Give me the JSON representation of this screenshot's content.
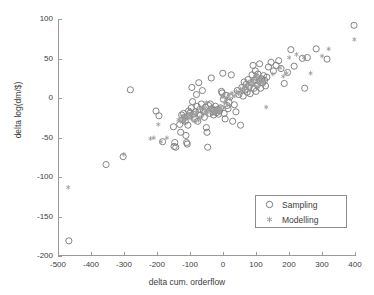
{
  "chart_data": {
    "type": "scatter",
    "title": "",
    "xlabel": "delta cum. orderflow",
    "ylabel": "delta log(dm/$)",
    "xlim": [
      -500,
      400
    ],
    "ylim": [
      -200,
      100
    ],
    "xticks": [
      -500,
      -400,
      -300,
      -200,
      -100,
      0,
      100,
      200,
      300,
      400
    ],
    "yticks": [
      -200,
      -150,
      -100,
      -50,
      0,
      50,
      100
    ],
    "xtick_labels": [
      "-500",
      "-400",
      "-300",
      "-200",
      "-100",
      "0",
      "100",
      "200",
      "300",
      "400"
    ],
    "ytick_labels": [
      "-200",
      "-150",
      "-100",
      "-50",
      "0",
      "50",
      "100"
    ],
    "grid": false,
    "legend_position": "lower right",
    "marker_color": "#808080",
    "axis_color": "#9a9a9a",
    "text_color": "#3d3d3d",
    "series": [
      {
        "name": "Sampling",
        "marker": "circle-open",
        "color": "#7d7d7d",
        "points": [
          [
            -470,
            -182
          ],
          [
            -357,
            -85
          ],
          [
            -305,
            -75
          ],
          [
            -283,
            10
          ],
          [
            -205,
            -17
          ],
          [
            -196,
            -23
          ],
          [
            -185,
            -56
          ],
          [
            -152,
            -37
          ],
          [
            -150,
            -62
          ],
          [
            -148,
            -57
          ],
          [
            -145,
            -63
          ],
          [
            -133,
            -34
          ],
          [
            -130,
            -44
          ],
          [
            -127,
            -22
          ],
          [
            -124,
            -28
          ],
          [
            -121,
            -20
          ],
          [
            -118,
            -25
          ],
          [
            -116,
            -30
          ],
          [
            -114,
            -48
          ],
          [
            -112,
            -57
          ],
          [
            -110,
            -59
          ],
          [
            -108,
            -35
          ],
          [
            -106,
            -17
          ],
          [
            -104,
            -23
          ],
          [
            -101,
            -19
          ],
          [
            -98,
            -13
          ],
          [
            -96,
            13
          ],
          [
            -94,
            -5
          ],
          [
            -91,
            -21
          ],
          [
            -88,
            -27
          ],
          [
            -85,
            -18
          ],
          [
            -82,
            4
          ],
          [
            -80,
            -11
          ],
          [
            -78,
            -30
          ],
          [
            -75,
            19
          ],
          [
            -72,
            -15
          ],
          [
            -70,
            -22
          ],
          [
            -67,
            -8
          ],
          [
            -64,
            9
          ],
          [
            -61,
            -17
          ],
          [
            -58,
            -25
          ],
          [
            -55,
            -12
          ],
          [
            -52,
            -38
          ],
          [
            -50,
            -44
          ],
          [
            -48,
            -63
          ],
          [
            -45,
            -10
          ],
          [
            -42,
            -20
          ],
          [
            -40,
            -8
          ],
          [
            -37,
            25
          ],
          [
            -35,
            -14
          ],
          [
            -32,
            -18
          ],
          [
            -30,
            -22
          ],
          [
            -27,
            -16
          ],
          [
            -24,
            -11
          ],
          [
            -21,
            -19
          ],
          [
            -18,
            -15
          ],
          [
            -15,
            -21
          ],
          [
            -12,
            -17
          ],
          [
            -9,
            -13
          ],
          [
            -6,
            8
          ],
          [
            -4,
            6
          ],
          [
            -2,
            31
          ],
          [
            0,
            -2
          ],
          [
            2,
            -20
          ],
          [
            5,
            -27
          ],
          [
            8,
            3
          ],
          [
            11,
            -10
          ],
          [
            14,
            -14
          ],
          [
            17,
            -6
          ],
          [
            20,
            1
          ],
          [
            24,
            29
          ],
          [
            28,
            -30
          ],
          [
            33,
            -9
          ],
          [
            38,
            -18
          ],
          [
            42,
            9
          ],
          [
            47,
            4
          ],
          [
            52,
            -35
          ],
          [
            56,
            13
          ],
          [
            60,
            2
          ],
          [
            63,
            20
          ],
          [
            66,
            10
          ],
          [
            69,
            17
          ],
          [
            72,
            7
          ],
          [
            75,
            23
          ],
          [
            78,
            14
          ],
          [
            81,
            5
          ],
          [
            84,
            19
          ],
          [
            87,
            29
          ],
          [
            90,
            41
          ],
          [
            93,
            12
          ],
          [
            95,
            22
          ],
          [
            97,
            34
          ],
          [
            99,
            8
          ],
          [
            101,
            26
          ],
          [
            103,
            16
          ],
          [
            105,
            30
          ],
          [
            108,
            21
          ],
          [
            110,
            43
          ],
          [
            113,
            12
          ],
          [
            116,
            24
          ],
          [
            119,
            19
          ],
          [
            122,
            28
          ],
          [
            125,
            22
          ],
          [
            128,
            15
          ],
          [
            132,
            26
          ],
          [
            137,
            39
          ],
          [
            145,
            45
          ],
          [
            152,
            34
          ],
          [
            160,
            41
          ],
          [
            168,
            47
          ],
          [
            175,
            37
          ],
          [
            185,
            18
          ],
          [
            195,
            32
          ],
          [
            205,
            61
          ],
          [
            215,
            40
          ],
          [
            240,
            50
          ],
          [
            247,
            12
          ],
          [
            255,
            51
          ],
          [
            282,
            62
          ],
          [
            315,
            49
          ],
          [
            397,
            92
          ]
        ]
      },
      {
        "name": "Modelling",
        "marker": "star",
        "color": "#9d9d9d",
        "points": [
          [
            -472,
            -114
          ],
          [
            -303,
            -72
          ],
          [
            -222,
            -52
          ],
          [
            -212,
            -51
          ],
          [
            -198,
            -34
          ],
          [
            -190,
            -56
          ],
          [
            -172,
            -51
          ],
          [
            -137,
            -28
          ],
          [
            -130,
            -30
          ],
          [
            -126,
            -24
          ],
          [
            -122,
            -27
          ],
          [
            -119,
            -31
          ],
          [
            -115,
            -23
          ],
          [
            -112,
            -26
          ],
          [
            -108,
            -20
          ],
          [
            -104,
            -25
          ],
          [
            -100,
            -22
          ],
          [
            -96,
            -27
          ],
          [
            -92,
            -19
          ],
          [
            -88,
            -30
          ],
          [
            -84,
            -22
          ],
          [
            -80,
            -18
          ],
          [
            -76,
            -29
          ],
          [
            -72,
            -25
          ],
          [
            -68,
            -14
          ],
          [
            -64,
            -21
          ],
          [
            -60,
            -12
          ],
          [
            -56,
            -18
          ],
          [
            -52,
            -6
          ],
          [
            -48,
            -19
          ],
          [
            -44,
            -16
          ],
          [
            -40,
            -13
          ],
          [
            -36,
            -17
          ],
          [
            -32,
            -20
          ],
          [
            -28,
            -15
          ],
          [
            -24,
            -18
          ],
          [
            -20,
            -16
          ],
          [
            -16,
            -14
          ],
          [
            -12,
            -17
          ],
          [
            -8,
            -12
          ],
          [
            -4,
            1
          ],
          [
            0,
            2
          ],
          [
            4,
            -6
          ],
          [
            8,
            -3
          ],
          [
            12,
            -9
          ],
          [
            16,
            4
          ],
          [
            20,
            -1
          ],
          [
            26,
            6
          ],
          [
            33,
            2
          ],
          [
            40,
            8
          ],
          [
            46,
            5
          ],
          [
            52,
            11
          ],
          [
            57,
            7
          ],
          [
            61,
            14
          ],
          [
            65,
            9
          ],
          [
            69,
            16
          ],
          [
            73,
            12
          ],
          [
            77,
            18
          ],
          [
            81,
            10
          ],
          [
            85,
            20
          ],
          [
            88,
            15
          ],
          [
            91,
            23
          ],
          [
            94,
            17
          ],
          [
            97,
            27
          ],
          [
            100,
            29
          ],
          [
            103,
            13
          ],
          [
            106,
            24
          ],
          [
            109,
            18
          ],
          [
            112,
            22
          ],
          [
            115,
            26
          ],
          [
            118,
            20
          ],
          [
            122,
            16
          ],
          [
            126,
            21
          ],
          [
            130,
            -12
          ],
          [
            150,
            30
          ],
          [
            172,
            38
          ],
          [
            182,
            27
          ],
          [
            192,
            31
          ],
          [
            200,
            51
          ],
          [
            222,
            55
          ],
          [
            245,
            51
          ],
          [
            265,
            31
          ],
          [
            300,
            53
          ],
          [
            320,
            62
          ],
          [
            398,
            74
          ]
        ]
      }
    ]
  },
  "legend": {
    "entries": [
      {
        "label": "Sampling",
        "marker": "circle-open"
      },
      {
        "label": "Modelling",
        "marker": "star"
      }
    ]
  }
}
